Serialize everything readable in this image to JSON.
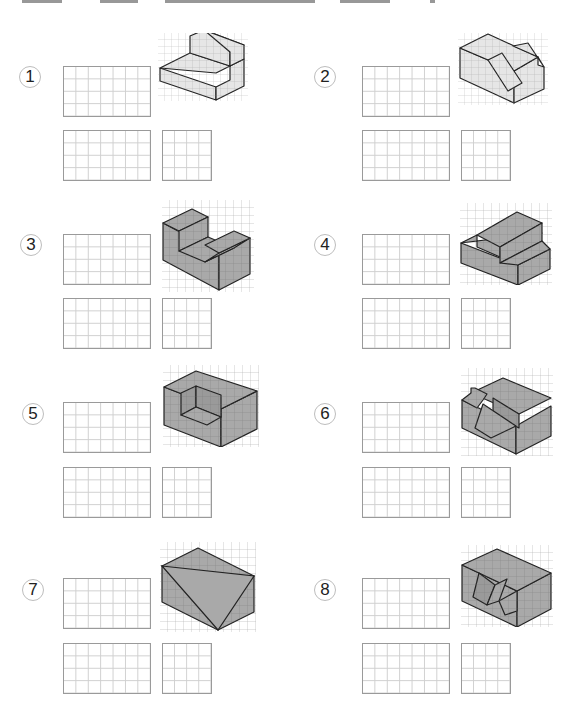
{
  "problems": [
    {
      "number": "1",
      "shade": "light"
    },
    {
      "number": "2",
      "shade": "light"
    },
    {
      "number": "3",
      "shade": "dark"
    },
    {
      "number": "4",
      "shade": "dark"
    },
    {
      "number": "5",
      "shade": "dark"
    },
    {
      "number": "6",
      "shade": "dark"
    },
    {
      "number": "7",
      "shade": "dark"
    },
    {
      "number": "8",
      "shade": "dark"
    }
  ],
  "colors": {
    "light_fill": "#e6e6e6",
    "dark_fill": "#a9a9a9",
    "edge": "#222222",
    "grid_line": "#cfcfcf",
    "grid_border": "#9a9a9a",
    "circle_border": "#bdbdbd"
  },
  "answer_grids": {
    "front_view": {
      "columns": 7,
      "rows": 4
    },
    "top_view": {
      "columns": 7,
      "rows": 4
    },
    "side_view": {
      "columns": 4,
      "rows": 4
    }
  }
}
